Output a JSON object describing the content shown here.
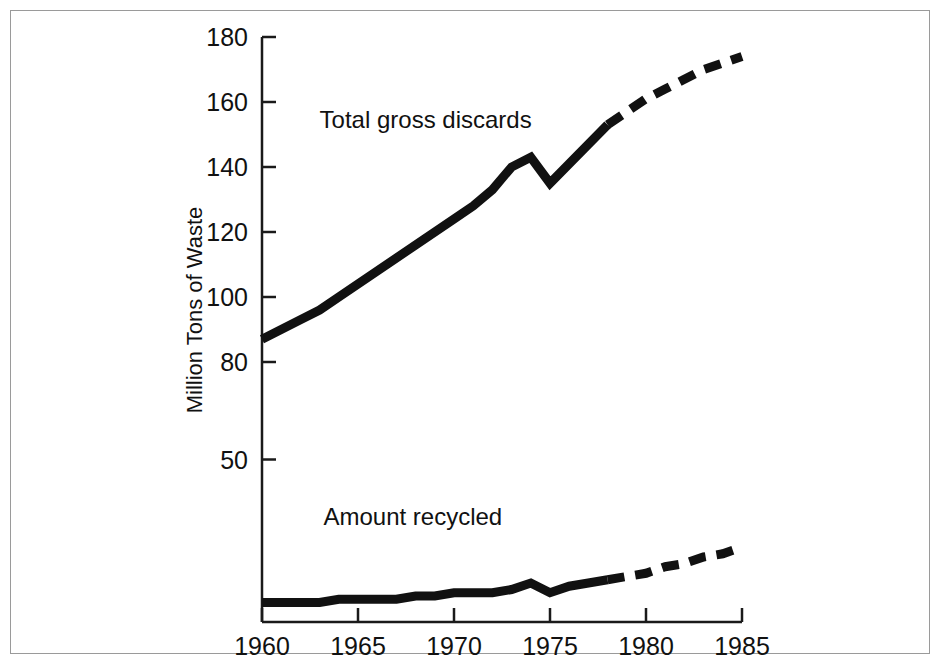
{
  "chart_data": {
    "type": "line",
    "title": "",
    "xlabel": "",
    "ylabel": "Million Tons of Waste",
    "xlim": [
      1960,
      1985
    ],
    "ylim": [
      0,
      180
    ],
    "grid": false,
    "legend_position": "inline-annotation",
    "x_ticks": [
      "1960",
      "1965",
      "1970",
      "1975",
      "1980",
      "1985"
    ],
    "x_tick_values": [
      1960,
      1965,
      1970,
      1975,
      1980,
      1985
    ],
    "y_ticks": [
      "50",
      "80",
      "100",
      "120",
      "140",
      "160",
      "180"
    ],
    "y_tick_values": [
      50,
      80,
      100,
      120,
      140,
      160,
      180
    ],
    "series": [
      {
        "name": "Total gross discards",
        "style": "solid-then-dashed",
        "projection_starts": 1978,
        "x": [
          1960,
          1961,
          1962,
          1963,
          1964,
          1965,
          1966,
          1967,
          1968,
          1969,
          1970,
          1971,
          1972,
          1973,
          1974,
          1975,
          1976,
          1977,
          1978,
          1979,
          1980,
          1981,
          1982,
          1983,
          1984,
          1985
        ],
        "values": [
          87,
          90,
          93,
          96,
          100,
          104,
          108,
          112,
          116,
          120,
          124,
          128,
          133,
          140,
          143,
          135,
          141,
          147,
          153,
          157,
          161,
          164,
          167,
          170,
          172,
          174
        ]
      },
      {
        "name": "Amount recycled",
        "style": "solid-then-dashed",
        "projection_starts": 1978,
        "x": [
          1960,
          1961,
          1962,
          1963,
          1964,
          1965,
          1966,
          1967,
          1968,
          1969,
          1970,
          1971,
          1972,
          1973,
          1974,
          1975,
          1976,
          1977,
          1978,
          1979,
          1980,
          1981,
          1982,
          1983,
          1984,
          1985
        ],
        "values": [
          6,
          6,
          6,
          6,
          7,
          7,
          7,
          7,
          8,
          8,
          9,
          9,
          9,
          10,
          12,
          9,
          11,
          12,
          13,
          14,
          15,
          17,
          18,
          20,
          21,
          23
        ]
      }
    ],
    "annotations": [
      {
        "text": "Total gross discards",
        "x": 1963.0,
        "y": 152
      },
      {
        "text": "Amount recycled",
        "x": 1963.2,
        "y": 30
      }
    ]
  },
  "figure": {
    "border_color": "#9a9a9a",
    "background": "#ffffff",
    "ink_color": "#111111"
  }
}
